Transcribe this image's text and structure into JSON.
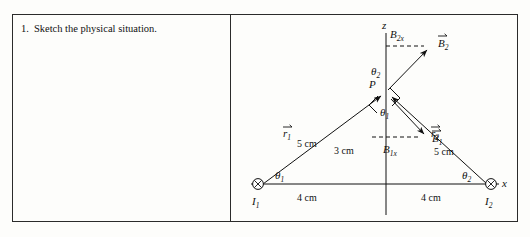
{
  "question": {
    "number": "1.",
    "text": "Sketch the physical situation."
  },
  "figure": {
    "axes": {
      "vertical_label": "z",
      "horizontal_label": "x"
    },
    "point_label": "P",
    "sources": [
      {
        "name": "current-source-left",
        "label": "I",
        "sub": "1",
        "symbol": "circle-x"
      },
      {
        "name": "current-source-right",
        "label": "I",
        "sub": "2",
        "symbol": "circle-x"
      }
    ],
    "vectors": [
      {
        "name": "r1",
        "label": "r",
        "sub": "1",
        "arrow": true
      },
      {
        "name": "r2",
        "label": "r",
        "sub": "2",
        "arrow": true
      },
      {
        "name": "B1",
        "label": "B",
        "sub": "1",
        "arrow": true
      },
      {
        "name": "B2",
        "label": "B",
        "sub": "2",
        "arrow": true
      }
    ],
    "components": [
      {
        "name": "B1x",
        "label": "B",
        "sub": "1x"
      },
      {
        "name": "B2x",
        "label": "B",
        "sub": "2x"
      }
    ],
    "angles": [
      {
        "name": "theta1-at-I1",
        "symbol": "θ",
        "sub": "1"
      },
      {
        "name": "theta1-at-P",
        "symbol": "θ",
        "sub": "1"
      },
      {
        "name": "theta2-at-P",
        "symbol": "θ",
        "sub": "2"
      },
      {
        "name": "theta2-at-I2",
        "symbol": "θ",
        "sub": "2"
      }
    ],
    "dimensions": {
      "left_base": "4 cm",
      "right_base": "4 cm",
      "height": "3 cm",
      "r1_length": "5 cm",
      "r2_length": "5 cm"
    },
    "colors": {
      "ink": "#111111",
      "border": "#2b2b2b",
      "paper": "#fdfdfb"
    }
  }
}
